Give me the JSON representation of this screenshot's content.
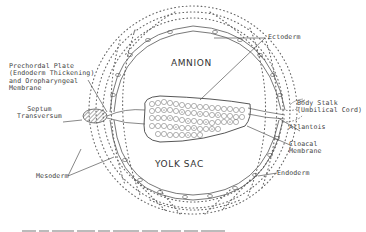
{
  "diagram": {
    "cavities": {
      "amnion": "AMNION",
      "yolk_sac": "YOLK SAC"
    },
    "labels": {
      "ectoderm": "Ectoderm",
      "prechordal_plate": "Prechordal Plate\n(Endoderm Thickening)\nand Oropharyngeal\nMembrane",
      "septum_transversum": "Septum\nTransversum",
      "body_stalk": "Body Stalk\n(Umbilical Cord)",
      "allantois": "Allantois",
      "cloacal_membrane": "Cloacal\nMembrane",
      "endoderm": "Endoderm",
      "mesoderm": "Mesoderm"
    },
    "colors": {
      "line": "#555555",
      "dots": "#666666",
      "text": "#444444"
    }
  }
}
